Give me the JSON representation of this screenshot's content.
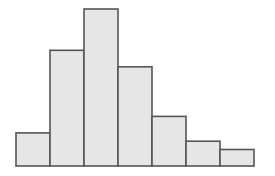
{
  "chart_data": {
    "type": "bar",
    "subtype": "histogram",
    "title": "",
    "xlabel": "",
    "ylabel": "",
    "categories": [
      "bin1",
      "bin2",
      "bin3",
      "bin4",
      "bin5",
      "bin6",
      "bin7"
    ],
    "values": [
      4,
      14,
      19,
      12,
      6,
      3,
      2
    ],
    "ylim": [
      0,
      19
    ],
    "grid": false,
    "axes_visible": false,
    "legend": "none",
    "colors": {
      "bar_fill": "#e6e6e6",
      "bar_stroke": "#555555"
    }
  }
}
